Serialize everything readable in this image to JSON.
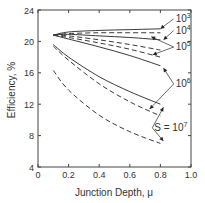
{
  "chart_data": {
    "type": "line",
    "title": "",
    "xlabel": "Junction Depth, μ",
    "ylabel": "Efficiency, %",
    "xlim": [
      0,
      1.0
    ],
    "ylim": [
      4,
      24
    ],
    "xticks": [
      "0",
      "0.2",
      "0.4",
      "0.6",
      "0.8",
      "1.0"
    ],
    "yticks": [
      "4",
      "8",
      "12",
      "16",
      "20",
      "24"
    ],
    "grid": false,
    "legend": "inline annotations with arrows",
    "series": [
      {
        "name": "S = 10^3 (solid)",
        "style": "solid",
        "x": [
          0.1,
          0.2,
          0.4,
          0.6,
          0.8
        ],
        "y": [
          20.8,
          21.2,
          21.4,
          21.5,
          21.6
        ]
      },
      {
        "name": "S = 10^3 (dashed)",
        "style": "dashed",
        "x": [
          0.1,
          0.2,
          0.4,
          0.6,
          0.8
        ],
        "y": [
          20.8,
          21.0,
          21.1,
          21.1,
          21.1
        ]
      },
      {
        "name": "S = 10^4 (solid)",
        "style": "solid",
        "x": [
          0.1,
          0.2,
          0.4,
          0.6,
          0.8
        ],
        "y": [
          20.8,
          20.9,
          20.7,
          20.5,
          20.2
        ]
      },
      {
        "name": "S = 10^4 (dashed)",
        "style": "dashed",
        "x": [
          0.1,
          0.2,
          0.4,
          0.6,
          0.8
        ],
        "y": [
          20.8,
          20.7,
          20.2,
          19.6,
          18.9
        ]
      },
      {
        "name": "S = 10^5 (dashed)",
        "style": "dashed",
        "x": [
          0.1,
          0.2,
          0.4,
          0.6,
          0.8
        ],
        "y": [
          20.8,
          20.5,
          19.8,
          19.0,
          18.0
        ]
      },
      {
        "name": "S = 10^5 (solid)",
        "style": "solid",
        "x": [
          0.1,
          0.2,
          0.4,
          0.6,
          0.8
        ],
        "y": [
          20.8,
          20.3,
          19.3,
          18.2,
          16.9
        ]
      },
      {
        "name": "S = 10^6 (solid)",
        "style": "solid",
        "x": [
          0.1,
          0.2,
          0.4,
          0.6,
          0.8
        ],
        "y": [
          19.6,
          18.0,
          15.5,
          13.6,
          12.0
        ]
      },
      {
        "name": "S = 10^6 (dashed)",
        "style": "dashed",
        "x": [
          0.1,
          0.2,
          0.4,
          0.6,
          0.8
        ],
        "y": [
          19.4,
          17.6,
          14.6,
          12.3,
          10.5
        ]
      },
      {
        "name": "S = 10^7 (dashed)",
        "style": "dashed",
        "x": [
          0.1,
          0.2,
          0.4,
          0.6,
          0.8
        ],
        "y": [
          16.3,
          13.8,
          10.6,
          8.5,
          7.0
        ]
      }
    ],
    "annotations": [
      {
        "text": "10",
        "exp": "3",
        "x": 0.9,
        "y": 22.5,
        "arrows": [
          [
            0.8,
            21.6
          ]
        ]
      },
      {
        "text": "10",
        "exp": "4",
        "x": 0.9,
        "y": 21.0,
        "arrows": [
          [
            0.82,
            20.2
          ]
        ]
      },
      {
        "text": "10",
        "exp": "5",
        "x": 0.9,
        "y": 18.9,
        "arrows": [
          [
            0.74,
            20.6
          ],
          [
            0.75,
            18.3
          ]
        ]
      },
      {
        "text": "10",
        "exp": "6",
        "x": 0.9,
        "y": 14.2,
        "arrows": [
          [
            0.82,
            16.6
          ],
          [
            0.73,
            11.4
          ]
        ]
      },
      {
        "text": "S = 10",
        "exp": "7",
        "x": 0.76,
        "y": 8.6,
        "arrows": [
          [
            0.82,
            11.6
          ],
          [
            0.82,
            7.3
          ]
        ]
      }
    ]
  }
}
